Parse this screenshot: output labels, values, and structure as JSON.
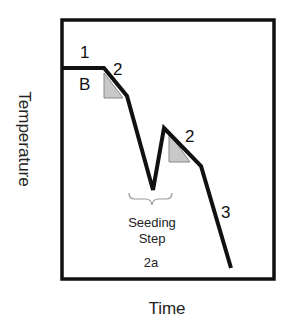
{
  "diagram": {
    "type": "temperature-time profile",
    "axes": {
      "x_label": "Time",
      "y_label": "Temperature"
    },
    "frame": {
      "x": 62,
      "y": 20,
      "width": 212,
      "height": 259
    },
    "curve": {
      "points": [
        [
          62,
          68
        ],
        [
          104,
          68
        ],
        [
          127,
          96
        ],
        [
          153,
          190
        ],
        [
          164,
          128
        ],
        [
          201,
          166
        ],
        [
          231,
          268
        ]
      ],
      "color": "#111111"
    },
    "triangles": [
      {
        "points": [
          [
            104,
            73
          ],
          [
            104,
            98
          ],
          [
            123,
            98
          ]
        ],
        "fill": "#c8c8c8"
      },
      {
        "points": [
          [
            169,
            133
          ],
          [
            169,
            162
          ],
          [
            190,
            162
          ]
        ],
        "fill": "#c8c8c8"
      }
    ],
    "labels": {
      "step1": "1",
      "boundary_b": "B",
      "step2_first": "2",
      "step2_second": "2",
      "step3": "3",
      "seeding_line1": "Seeding",
      "seeding_line2": "Step",
      "seeding_id": "2a"
    }
  }
}
